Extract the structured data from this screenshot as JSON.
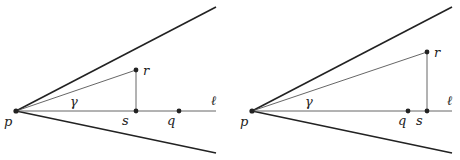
{
  "figures": [
    {
      "name": "left",
      "labels": {
        "p": "p",
        "r": "r",
        "s": "s",
        "q": "q",
        "gamma": "γ",
        "ell": "ℓ"
      },
      "points": {
        "p": [
          16,
          111
        ],
        "r": [
          136,
          70
        ],
        "s": [
          136,
          111
        ],
        "q": [
          179,
          111
        ]
      },
      "cone_upper_end": [
        216,
        7
      ],
      "cone_lower_end": [
        216,
        153
      ],
      "line_end": [
        216,
        111
      ]
    },
    {
      "name": "right",
      "labels": {
        "p": "p",
        "r": "r",
        "s": "s",
        "q": "q",
        "gamma": "γ",
        "ell": "ℓ"
      },
      "points": {
        "p": [
          252,
          111
        ],
        "r": [
          427,
          52
        ],
        "s": [
          427,
          111
        ],
        "q": [
          408,
          111
        ]
      },
      "cone_upper_end": [
        452,
        7
      ],
      "cone_lower_end": [
        452,
        153
      ],
      "line_end": [
        452,
        111
      ]
    }
  ],
  "colors": {
    "ink": "#222222",
    "thin": "#555555"
  }
}
